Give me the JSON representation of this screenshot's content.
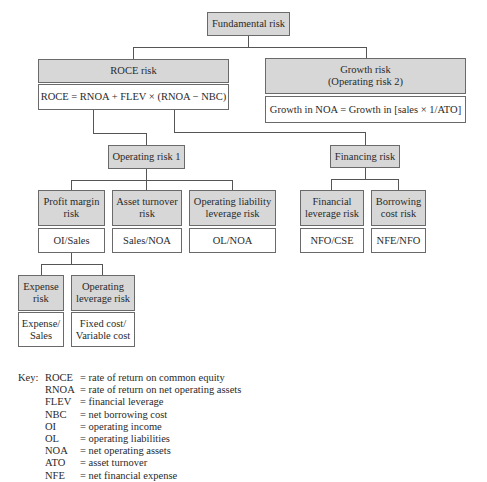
{
  "diagram": {
    "root": {
      "label": "Fundamental risk"
    },
    "roce": {
      "label": "ROCE risk",
      "formula": "ROCE = RNOA + FLEV × (RNOA − NBC)"
    },
    "growth": {
      "label": "Growth risk\n(Operating risk 2)",
      "formula": "Growth in NOA = Growth in [sales × 1/ATO]"
    },
    "operating": {
      "label": "Operating risk 1"
    },
    "financing": {
      "label": "Financing risk"
    },
    "profit_margin": {
      "label": "Profit margin\nrisk",
      "formula": "OI/Sales"
    },
    "asset_turnover": {
      "label": "Asset turnover\nrisk",
      "formula": "Sales/NOA"
    },
    "ol_leverage": {
      "label": "Operating liability\nleverage risk",
      "formula": "OL/NOA"
    },
    "fin_leverage": {
      "label": "Financial\nleverage risk",
      "formula": "NFO/CSE"
    },
    "borrowing_cost": {
      "label": "Borrowing\ncost risk",
      "formula": "NFE/NFO"
    },
    "expense": {
      "label": "Expense\nrisk",
      "formula": "Expense/\nSales"
    },
    "op_leverage": {
      "label": "Operating\nleverage risk",
      "formula": "Fixed cost/\nVariable cost"
    }
  },
  "key": {
    "label": "Key:",
    "items": [
      {
        "abbr": "ROCE",
        "def": "= rate of return on common equity"
      },
      {
        "abbr": "RNOA",
        "def": "= rate of return on net operating assets"
      },
      {
        "abbr": "FLEV",
        "def": "= financial leverage"
      },
      {
        "abbr": "NBC",
        "def": "= net borrowing cost"
      },
      {
        "abbr": "OI",
        "def": "= operating income"
      },
      {
        "abbr": "OL",
        "def": "= operating liabilities"
      },
      {
        "abbr": "NOA",
        "def": "= net operating assets"
      },
      {
        "abbr": "ATO",
        "def": "= asset turnover"
      },
      {
        "abbr": "NFE",
        "def": "= net financial expense"
      }
    ]
  }
}
